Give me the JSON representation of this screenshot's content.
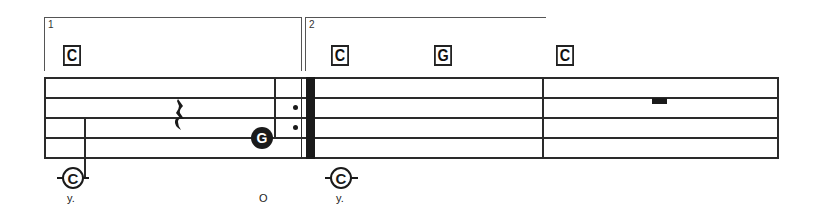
{
  "score": {
    "voltas": [
      {
        "number": "1"
      },
      {
        "number": "2"
      }
    ],
    "chords": [
      {
        "label": "C"
      },
      {
        "label": "C"
      },
      {
        "label": "G"
      },
      {
        "label": "C"
      }
    ],
    "notes": [
      {
        "label": "G",
        "style": "filled"
      },
      {
        "label": "C",
        "style": "open"
      },
      {
        "label": "C",
        "style": "open"
      }
    ],
    "lyrics": [
      {
        "text": "y."
      },
      {
        "text": "O"
      },
      {
        "text": "y."
      }
    ],
    "rests": [
      "quarter-rest",
      "half-rest"
    ],
    "repeat_sign": "end-repeat"
  },
  "colors": {
    "ink": "#1a1a1a",
    "background": "#ffffff"
  }
}
